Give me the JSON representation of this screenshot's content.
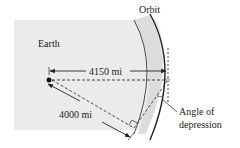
{
  "diagram": {
    "labels": {
      "orbit": "Orbit",
      "earth": "Earth",
      "distance_to_satellite": "4150 mi",
      "earth_radius": "4000 mi",
      "angle_line1": "Angle of",
      "angle_line2": "depression"
    },
    "colors": {
      "earth_fill": "#ebebeb",
      "orbit_band_fill": "#dcdcdc",
      "line": "#222222",
      "background": "#ffffff"
    }
  }
}
